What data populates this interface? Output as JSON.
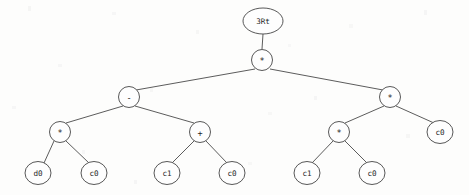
{
  "figure": {
    "kind": "expression-tree",
    "background_color": "#fdfdfc",
    "stroke_color": "#4f4f4f",
    "text_color": "#1e1e1e",
    "width": 469,
    "height": 195
  },
  "nodes": [
    {
      "id": "n0",
      "label": "3Rt",
      "x": 263,
      "y": 21,
      "rx": 20,
      "ry": 13,
      "role": "root-label",
      "size": "sm"
    },
    {
      "id": "n1",
      "label": "*",
      "x": 262,
      "y": 60,
      "rx": 10.5,
      "ry": 10.5,
      "role": "operator",
      "size": "op"
    },
    {
      "id": "n2",
      "label": "-",
      "x": 129,
      "y": 97,
      "rx": 10.5,
      "ry": 10.5,
      "role": "operator",
      "size": "op"
    },
    {
      "id": "n3",
      "label": "*",
      "x": 390,
      "y": 97,
      "rx": 10.5,
      "ry": 10.5,
      "role": "operator",
      "size": "op"
    },
    {
      "id": "n4",
      "label": "*",
      "x": 60,
      "y": 132,
      "rx": 10.5,
      "ry": 10.5,
      "role": "operator",
      "size": "op"
    },
    {
      "id": "n5",
      "label": "+",
      "x": 200,
      "y": 132,
      "rx": 10.5,
      "ry": 10.5,
      "role": "operator",
      "size": "op"
    },
    {
      "id": "n6",
      "label": "*",
      "x": 339,
      "y": 132,
      "rx": 10.5,
      "ry": 10.5,
      "role": "operator",
      "size": "op"
    },
    {
      "id": "n7",
      "label": "c0",
      "x": 440,
      "y": 132,
      "rx": 13,
      "ry": 11.5,
      "role": "terminal",
      "size": "sm"
    },
    {
      "id": "n8",
      "label": "d0",
      "x": 38,
      "y": 173,
      "rx": 13,
      "ry": 11.5,
      "role": "terminal",
      "size": "sm"
    },
    {
      "id": "n9",
      "label": "c0",
      "x": 94,
      "y": 173,
      "rx": 13,
      "ry": 11.5,
      "role": "terminal",
      "size": "sm"
    },
    {
      "id": "n10",
      "label": "c1",
      "x": 167,
      "y": 173,
      "rx": 13,
      "ry": 11.5,
      "role": "terminal",
      "size": "sm"
    },
    {
      "id": "n11",
      "label": "c0",
      "x": 232,
      "y": 173,
      "rx": 13,
      "ry": 11.5,
      "role": "terminal",
      "size": "sm"
    },
    {
      "id": "n12",
      "label": "c1",
      "x": 307,
      "y": 173,
      "rx": 13,
      "ry": 11.5,
      "role": "terminal",
      "size": "sm"
    },
    {
      "id": "n13",
      "label": "c0",
      "x": 372,
      "y": 173,
      "rx": 13,
      "ry": 11.5,
      "role": "terminal",
      "size": "sm"
    }
  ],
  "edges": [
    {
      "from": "n0",
      "to": "n1",
      "x1": 263,
      "y1": 34,
      "x2": 262,
      "y2": 49
    },
    {
      "from": "n1",
      "to": "n2",
      "x1": 255,
      "y1": 69,
      "x2": 136,
      "y2": 90
    },
    {
      "from": "n1",
      "to": "n3",
      "x1": 270,
      "y1": 69,
      "x2": 383,
      "y2": 90
    },
    {
      "from": "n2",
      "to": "n4",
      "x1": 123,
      "y1": 106,
      "x2": 66,
      "y2": 123
    },
    {
      "from": "n2",
      "to": "n5",
      "x1": 135,
      "y1": 106,
      "x2": 194,
      "y2": 123
    },
    {
      "from": "n3",
      "to": "n6",
      "x1": 384,
      "y1": 106,
      "x2": 345,
      "y2": 123
    },
    {
      "from": "n3",
      "to": "n7",
      "x1": 396,
      "y1": 106,
      "x2": 434,
      "y2": 123
    },
    {
      "from": "n4",
      "to": "n8",
      "x1": 54,
      "y1": 141,
      "x2": 44,
      "y2": 163
    },
    {
      "from": "n4",
      "to": "n9",
      "x1": 66,
      "y1": 141,
      "x2": 89,
      "y2": 163
    },
    {
      "from": "n5",
      "to": "n10",
      "x1": 194,
      "y1": 141,
      "x2": 172,
      "y2": 163
    },
    {
      "from": "n5",
      "to": "n11",
      "x1": 206,
      "y1": 141,
      "x2": 227,
      "y2": 163
    },
    {
      "from": "n6",
      "to": "n12",
      "x1": 333,
      "y1": 141,
      "x2": 312,
      "y2": 163
    },
    {
      "from": "n6",
      "to": "n13",
      "x1": 345,
      "y1": 141,
      "x2": 367,
      "y2": 163
    }
  ],
  "tree_structure": {
    "label": "3Rt",
    "expression": "((d0 * c0) - (c1 + c0)) * ((c1 * c0) * c0)",
    "root": {
      "value": "*",
      "children": [
        {
          "value": "-",
          "children": [
            {
              "value": "*",
              "children": [
                {
                  "value": "d0"
                },
                {
                  "value": "c0"
                }
              ]
            },
            {
              "value": "+",
              "children": [
                {
                  "value": "c1"
                },
                {
                  "value": "c0"
                }
              ]
            }
          ]
        },
        {
          "value": "*",
          "children": [
            {
              "value": "*",
              "children": [
                {
                  "value": "c1"
                },
                {
                  "value": "c0"
                }
              ]
            },
            {
              "value": "c0"
            }
          ]
        }
      ]
    }
  }
}
